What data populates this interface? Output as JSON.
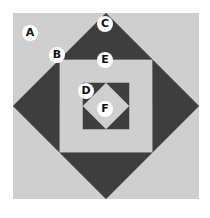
{
  "diagram": {
    "type": "quilt-block",
    "colors": {
      "light": "#cfcfcf",
      "medium": "#8a8a8a",
      "dark": "#3e3e3e",
      "background": "#ffffff"
    },
    "labels": [
      {
        "id": "A",
        "x": 30,
        "y": 33
      },
      {
        "id": "B",
        "x": 57,
        "y": 55
      },
      {
        "id": "C",
        "x": 105,
        "y": 24
      },
      {
        "id": "E",
        "x": 105,
        "y": 60
      },
      {
        "id": "D",
        "x": 86,
        "y": 91
      },
      {
        "id": "F",
        "x": 105,
        "y": 109
      }
    ]
  }
}
